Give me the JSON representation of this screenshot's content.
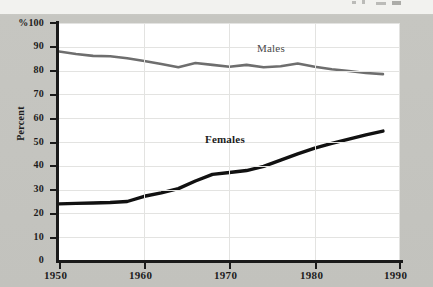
{
  "figure": {
    "background_color": "#c2c2bd",
    "plot_background_color": "#ffffff"
  },
  "axis": {
    "y_title": "Percent",
    "y_top_label": "%100",
    "y_ticks": [
      "100",
      "90",
      "80",
      "70",
      "60",
      "50",
      "40",
      "30",
      "20",
      "10",
      "0"
    ],
    "x_ticks": [
      "1950",
      "1960",
      "1970",
      "1980",
      "1990"
    ]
  },
  "labels": {
    "males": "Males",
    "females": "Females"
  },
  "chart_data": {
    "type": "line",
    "title": "",
    "subtitle": "",
    "xlabel": "",
    "ylabel": "Percent",
    "xlim": [
      1950,
      1990
    ],
    "ylim": [
      0,
      100
    ],
    "xticks": [
      1950,
      1960,
      1970,
      1980,
      1990
    ],
    "yticks": [
      0,
      10,
      20,
      30,
      40,
      50,
      60,
      70,
      80,
      90,
      100
    ],
    "grid": true,
    "legend": "inline-labels",
    "x": [
      1950,
      1952,
      1954,
      1956,
      1958,
      1960,
      1962,
      1964,
      1966,
      1968,
      1970,
      1972,
      1974,
      1976,
      1978,
      1980,
      1982,
      1984,
      1986,
      1988
    ],
    "series": [
      {
        "name": "Males",
        "color": "#6e6e6e",
        "line_width": 2.6,
        "values": [
          88.0,
          87.0,
          86.2,
          86.0,
          85.2,
          84.0,
          82.8,
          81.4,
          83.2,
          82.4,
          81.6,
          82.4,
          81.4,
          81.8,
          83.0,
          81.6,
          80.6,
          79.8,
          79.0,
          78.5
        ],
        "label_position": {
          "x": 1977,
          "y": 92
        }
      },
      {
        "name": "Females",
        "color": "#111111",
        "line_width": 3.4,
        "values": [
          24.0,
          24.2,
          24.4,
          24.6,
          25.0,
          27.2,
          28.6,
          30.4,
          33.6,
          36.4,
          37.2,
          38.0,
          39.8,
          42.4,
          45.0,
          47.4,
          49.4,
          51.2,
          53.0,
          54.6
        ],
        "label_position": {
          "x": 1967,
          "y": 46
        }
      }
    ]
  }
}
